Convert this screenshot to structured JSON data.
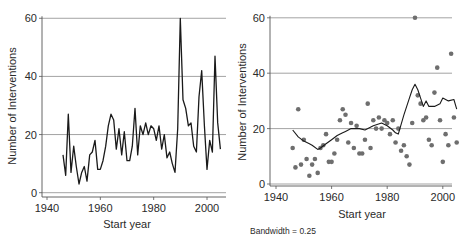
{
  "chart_data": [
    {
      "type": "line",
      "title": "",
      "xlabel": "Start year",
      "ylabel": "Number of Interventions",
      "xlim": [
        1940,
        2007
      ],
      "ylim": [
        0,
        60
      ],
      "xticks": [
        1940,
        1960,
        1980,
        2000
      ],
      "yticks": [
        0,
        20,
        40,
        60
      ],
      "grid": "horizontal",
      "legend": null,
      "x": [
        1946,
        1947,
        1948,
        1949,
        1950,
        1951,
        1952,
        1953,
        1954,
        1955,
        1956,
        1957,
        1958,
        1959,
        1960,
        1961,
        1962,
        1963,
        1964,
        1965,
        1966,
        1967,
        1968,
        1969,
        1970,
        1971,
        1972,
        1973,
        1974,
        1975,
        1976,
        1977,
        1978,
        1979,
        1980,
        1981,
        1982,
        1983,
        1984,
        1985,
        1986,
        1987,
        1988,
        1989,
        1990,
        1991,
        1992,
        1993,
        1994,
        1995,
        1996,
        1997,
        1998,
        1999,
        2000,
        2001,
        2002,
        2003,
        2004,
        2005
      ],
      "series": [
        {
          "name": "Interventions",
          "values": [
            13,
            6,
            27,
            7,
            16,
            9,
            3,
            7,
            9,
            4,
            13,
            14,
            18,
            8,
            8,
            11,
            16,
            23,
            27,
            25,
            15,
            22,
            13,
            21,
            11,
            11,
            16,
            29,
            13,
            23,
            20,
            24,
            20,
            23,
            22,
            18,
            23,
            15,
            20,
            12,
            14,
            10,
            7,
            22,
            60,
            32,
            29,
            23,
            24,
            16,
            14,
            33,
            42,
            23,
            8,
            18,
            14,
            47,
            24,
            15
          ]
        }
      ]
    },
    {
      "type": "scatter",
      "title": "",
      "xlabel": "Start year",
      "ylabel": "Number of Interventions",
      "xlim": [
        1940,
        2007
      ],
      "ylim": [
        0,
        60
      ],
      "xticks": [
        1940,
        1960,
        1980,
        2000
      ],
      "yticks": [
        0,
        20,
        40,
        60
      ],
      "grid": "horizontal",
      "annotation": "Bandwidth = 0.25",
      "x": [
        1946,
        1947,
        1948,
        1949,
        1950,
        1951,
        1952,
        1953,
        1954,
        1955,
        1956,
        1957,
        1958,
        1959,
        1960,
        1961,
        1962,
        1963,
        1964,
        1965,
        1966,
        1967,
        1968,
        1969,
        1970,
        1971,
        1972,
        1973,
        1974,
        1975,
        1976,
        1977,
        1978,
        1979,
        1980,
        1981,
        1982,
        1983,
        1984,
        1985,
        1986,
        1987,
        1988,
        1989,
        1990,
        1991,
        1992,
        1993,
        1994,
        1995,
        1996,
        1997,
        1998,
        1999,
        2000,
        2001,
        2002,
        2003,
        2004,
        2005
      ],
      "series": [
        {
          "name": "Observed",
          "kind": "points",
          "values": [
            13,
            6,
            27,
            7,
            16,
            9,
            3,
            7,
            9,
            4,
            13,
            14,
            18,
            8,
            8,
            11,
            16,
            23,
            27,
            25,
            15,
            22,
            13,
            21,
            11,
            11,
            16,
            29,
            13,
            23,
            20,
            24,
            20,
            23,
            22,
            18,
            23,
            15,
            20,
            12,
            14,
            10,
            7,
            22,
            60,
            32,
            29,
            23,
            24,
            16,
            14,
            33,
            42,
            23,
            8,
            18,
            14,
            47,
            24,
            15
          ]
        },
        {
          "name": "Lowess smooth (bandwidth 0.25)",
          "kind": "line",
          "x": [
            1946,
            1948,
            1950,
            1952,
            1953,
            1955,
            1956,
            1958,
            1960,
            1962,
            1964,
            1965,
            1967,
            1970,
            1972,
            1975,
            1978,
            1980,
            1982,
            1983,
            1984,
            1986,
            1988,
            1989,
            1990,
            1991,
            1992,
            1993,
            1994,
            1995,
            1997,
            1999,
            2000,
            2002,
            2004,
            2005
          ],
          "values": [
            19.5,
            17,
            15.5,
            14.5,
            14,
            12.5,
            13,
            14.5,
            16,
            17.5,
            18.5,
            19,
            20,
            20,
            19.5,
            21,
            22,
            21,
            19.5,
            18.5,
            18,
            25,
            31,
            34,
            36,
            34,
            31,
            28,
            30,
            28,
            28,
            29,
            31,
            30,
            30.5,
            27
          ]
        }
      ]
    }
  ],
  "left_panel": {
    "ylabel": "Number of Interventions",
    "xlabel": "Start year",
    "yticks": [
      "0",
      "20",
      "40",
      "60"
    ],
    "xticks": [
      "1940",
      "1960",
      "1980",
      "2000"
    ]
  },
  "right_panel": {
    "ylabel": "Number of Interventions",
    "xlabel": "Start year",
    "yticks": [
      "0",
      "20",
      "40",
      "60"
    ],
    "xticks": [
      "1940",
      "1960",
      "1980",
      "2000"
    ],
    "annotation": "Bandwidth = 0.25"
  },
  "colors": {
    "line": "#1a1a1a",
    "points": "#6e6e6e",
    "smooth": "#1a1a1a",
    "grid": "#8c8c8c",
    "axis": "#555555"
  }
}
